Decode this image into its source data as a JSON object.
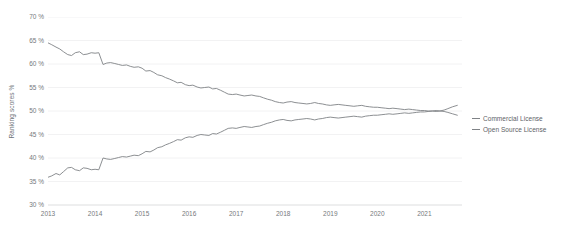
{
  "chart_data": {
    "type": "line",
    "title": "",
    "xlabel": "",
    "ylabel": "Ranking scores %",
    "grid": true,
    "legend_position": "right",
    "xlim": [
      2013.0,
      2021.8
    ],
    "ylim": [
      30,
      70
    ],
    "ytick_labels": [
      "70 %",
      "65 %",
      "60 %",
      "55 %",
      "50 %",
      "45 %",
      "40 %",
      "35 %",
      "30 %"
    ],
    "ytick_values": [
      70,
      65,
      60,
      55,
      50,
      45,
      40,
      35,
      30
    ],
    "xtick_labels": [
      "2013",
      "2014",
      "2015",
      "2016",
      "2017",
      "2018",
      "2019",
      "2020",
      "2021"
    ],
    "xtick_values": [
      2013,
      2014,
      2015,
      2016,
      2017,
      2018,
      2019,
      2020,
      2021
    ],
    "line_color": "#7f8286",
    "grid_color": "#f2f2f3",
    "axis_color": "#e3e4e5",
    "background_color": "#ffffff",
    "series": [
      {
        "name": "Commercial License",
        "color": "#7f8286",
        "x": [
          2013.0,
          2013.08,
          2013.17,
          2013.25,
          2013.33,
          2013.42,
          2013.5,
          2013.58,
          2013.67,
          2013.75,
          2013.83,
          2013.92,
          2014.0,
          2014.08,
          2014.17,
          2014.25,
          2014.33,
          2014.42,
          2014.5,
          2014.58,
          2014.67,
          2014.75,
          2014.83,
          2014.92,
          2015.0,
          2015.08,
          2015.17,
          2015.25,
          2015.33,
          2015.42,
          2015.5,
          2015.58,
          2015.67,
          2015.75,
          2015.83,
          2015.92,
          2016.0,
          2016.08,
          2016.17,
          2016.25,
          2016.33,
          2016.42,
          2016.5,
          2016.58,
          2016.67,
          2016.75,
          2016.83,
          2016.92,
          2017.0,
          2017.08,
          2017.17,
          2017.25,
          2017.33,
          2017.42,
          2017.5,
          2017.58,
          2017.67,
          2017.75,
          2017.83,
          2017.92,
          2018.0,
          2018.08,
          2018.17,
          2018.25,
          2018.33,
          2018.42,
          2018.5,
          2018.58,
          2018.67,
          2018.75,
          2018.83,
          2018.92,
          2019.0,
          2019.08,
          2019.17,
          2019.25,
          2019.33,
          2019.42,
          2019.5,
          2019.58,
          2019.67,
          2019.75,
          2019.83,
          2019.92,
          2020.0,
          2020.08,
          2020.17,
          2020.25,
          2020.33,
          2020.42,
          2020.5,
          2020.58,
          2020.67,
          2020.75,
          2020.83,
          2020.92,
          2021.0,
          2021.08,
          2021.17,
          2021.25,
          2021.33,
          2021.42,
          2021.5,
          2021.6,
          2021.7
        ],
        "values": [
          64.5,
          64.1,
          63.6,
          63.2,
          62.6,
          62.0,
          61.8,
          62.4,
          62.6,
          62.0,
          62.1,
          62.4,
          62.3,
          62.4,
          59.9,
          60.2,
          60.3,
          60.1,
          59.9,
          59.7,
          59.8,
          59.5,
          59.3,
          59.4,
          59.1,
          58.5,
          58.6,
          58.2,
          57.7,
          57.5,
          57.1,
          56.8,
          56.4,
          56.0,
          56.1,
          55.6,
          55.4,
          55.5,
          55.1,
          54.9,
          55.0,
          55.1,
          54.7,
          54.8,
          54.4,
          54.0,
          53.6,
          53.5,
          53.6,
          53.4,
          53.2,
          53.3,
          53.4,
          53.2,
          53.1,
          52.8,
          52.5,
          52.3,
          52.0,
          51.8,
          51.7,
          51.9,
          52.0,
          51.8,
          51.7,
          51.6,
          51.5,
          51.6,
          51.8,
          51.6,
          51.5,
          51.3,
          51.2,
          51.3,
          51.4,
          51.3,
          51.2,
          51.1,
          51.0,
          51.1,
          51.2,
          51.0,
          50.9,
          50.8,
          50.8,
          50.7,
          50.6,
          50.5,
          50.6,
          50.5,
          50.4,
          50.3,
          50.4,
          50.3,
          50.2,
          50.1,
          50.1,
          50.0,
          50.0,
          50.1,
          50.0,
          49.9,
          49.7,
          49.4,
          49.1
        ]
      },
      {
        "name": "Open Source License",
        "color": "#7f8286",
        "x": [
          2013.0,
          2013.08,
          2013.17,
          2013.25,
          2013.33,
          2013.42,
          2013.5,
          2013.58,
          2013.67,
          2013.75,
          2013.83,
          2013.92,
          2014.0,
          2014.08,
          2014.17,
          2014.25,
          2014.33,
          2014.42,
          2014.5,
          2014.58,
          2014.67,
          2014.75,
          2014.83,
          2014.92,
          2015.0,
          2015.08,
          2015.17,
          2015.25,
          2015.33,
          2015.42,
          2015.5,
          2015.58,
          2015.67,
          2015.75,
          2015.83,
          2015.92,
          2016.0,
          2016.08,
          2016.17,
          2016.25,
          2016.33,
          2016.42,
          2016.5,
          2016.58,
          2016.67,
          2016.75,
          2016.83,
          2016.92,
          2017.0,
          2017.08,
          2017.17,
          2017.25,
          2017.33,
          2017.42,
          2017.5,
          2017.58,
          2017.67,
          2017.75,
          2017.83,
          2017.92,
          2018.0,
          2018.08,
          2018.17,
          2018.25,
          2018.33,
          2018.42,
          2018.5,
          2018.58,
          2018.67,
          2018.75,
          2018.83,
          2018.92,
          2019.0,
          2019.08,
          2019.17,
          2019.25,
          2019.33,
          2019.42,
          2019.5,
          2019.58,
          2019.67,
          2019.75,
          2019.83,
          2019.92,
          2020.0,
          2020.08,
          2020.17,
          2020.25,
          2020.33,
          2020.42,
          2020.5,
          2020.58,
          2020.67,
          2020.75,
          2020.83,
          2020.92,
          2021.0,
          2021.08,
          2021.17,
          2021.25,
          2021.33,
          2021.42,
          2021.5,
          2021.6,
          2021.7
        ],
        "values": [
          35.9,
          36.2,
          36.7,
          36.4,
          37.1,
          37.9,
          38.0,
          37.5,
          37.3,
          37.9,
          37.8,
          37.5,
          37.6,
          37.5,
          40.0,
          39.8,
          39.7,
          39.9,
          40.1,
          40.3,
          40.2,
          40.4,
          40.6,
          40.5,
          40.9,
          41.4,
          41.3,
          41.7,
          42.2,
          42.4,
          42.8,
          43.1,
          43.5,
          43.9,
          43.8,
          44.3,
          44.5,
          44.4,
          44.8,
          45.0,
          44.9,
          44.8,
          45.2,
          45.1,
          45.5,
          45.9,
          46.3,
          46.4,
          46.3,
          46.5,
          46.7,
          46.6,
          46.5,
          46.7,
          46.8,
          47.1,
          47.4,
          47.6,
          47.9,
          48.1,
          48.2,
          48.0,
          47.9,
          48.1,
          48.2,
          48.3,
          48.4,
          48.3,
          48.1,
          48.3,
          48.4,
          48.6,
          48.7,
          48.6,
          48.5,
          48.6,
          48.7,
          48.8,
          48.9,
          48.8,
          48.7,
          48.9,
          49.0,
          49.1,
          49.1,
          49.2,
          49.3,
          49.4,
          49.3,
          49.4,
          49.5,
          49.6,
          49.5,
          49.6,
          49.7,
          49.8,
          49.8,
          49.9,
          50.0,
          49.9,
          50.0,
          50.2,
          50.5,
          50.9,
          51.2
        ]
      }
    ]
  },
  "legend": {
    "items": [
      {
        "label": "Commercial License"
      },
      {
        "label": "Open Source License"
      }
    ]
  }
}
